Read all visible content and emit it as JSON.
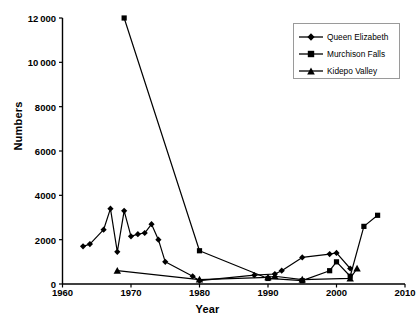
{
  "chart_data": {
    "type": "line",
    "title": "",
    "xlabel": "Year",
    "ylabel": "Numbers",
    "xlim": [
      1960,
      2010
    ],
    "ylim": [
      0,
      12000
    ],
    "xticks": [
      "1960",
      "1970",
      "1980",
      "1990",
      "2000",
      "2010"
    ],
    "xtick_values": [
      1960,
      1970,
      1980,
      1990,
      2000,
      2010
    ],
    "yticks": [
      "0",
      "2000",
      "4000",
      "6000",
      "8000",
      "10 000",
      "12 000"
    ],
    "ytick_values": [
      0,
      2000,
      4000,
      6000,
      8000,
      10000,
      12000
    ],
    "grid": false,
    "legend_position": "top-right",
    "series": [
      {
        "name": "Queen Elizabeth",
        "marker": "diamond",
        "color": "#000000",
        "points": [
          [
            1963,
            1700
          ],
          [
            1964,
            1800
          ],
          [
            1966,
            2450
          ],
          [
            1967,
            3400
          ],
          [
            1968,
            1450
          ],
          [
            1969,
            3300
          ],
          [
            1970,
            2150
          ],
          [
            1971,
            2250
          ],
          [
            1972,
            2300
          ],
          [
            1973,
            2700
          ],
          [
            1974,
            2000
          ],
          [
            1975,
            1000
          ],
          [
            1979,
            350
          ],
          [
            1980,
            150
          ],
          [
            1988,
            400
          ],
          [
            1991,
            450
          ],
          [
            1992,
            600
          ],
          [
            1995,
            1200
          ],
          [
            1999,
            1350
          ],
          [
            2000,
            1400
          ],
          [
            2002,
            700
          ]
        ]
      },
      {
        "name": "Murchison Falls",
        "marker": "square",
        "color": "#000000",
        "points": [
          [
            1969,
            12000
          ],
          [
            1980,
            1500
          ],
          [
            1990,
            250
          ],
          [
            1995,
            150
          ],
          [
            1999,
            600
          ],
          [
            2000,
            1000
          ],
          [
            2002,
            350
          ],
          [
            2004,
            2600
          ],
          [
            2006,
            3100
          ]
        ]
      },
      {
        "name": "Kidepo Valley",
        "marker": "triangle",
        "color": "#000000",
        "points": [
          [
            1968,
            600
          ],
          [
            1980,
            200
          ],
          [
            1990,
            300
          ],
          [
            1991,
            350
          ],
          [
            1995,
            200
          ],
          [
            2002,
            250
          ],
          [
            2003,
            700
          ]
        ]
      }
    ]
  },
  "legend": {
    "items": [
      {
        "label": "Queen Elizabeth",
        "marker": "diamond"
      },
      {
        "label": "Murchison Falls",
        "marker": "square"
      },
      {
        "label": "Kidepo Valley",
        "marker": "triangle"
      }
    ]
  }
}
